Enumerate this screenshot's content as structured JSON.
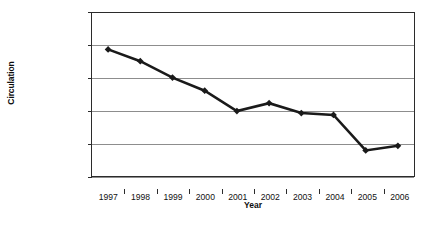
{
  "chart_data": {
    "type": "line",
    "title": "",
    "xlabel": "Year",
    "ylabel": "Circulation",
    "categories": [
      "1997",
      "1998",
      "1999",
      "2000",
      "2001",
      "2002",
      "2003",
      "2004",
      "2005",
      "2006"
    ],
    "values": [
      104300000,
      102500000,
      100000000,
      98000000,
      94900000,
      96100000,
      94600000,
      94300000,
      88900000,
      89600000
    ],
    "series": [
      {
        "name": "Circulation",
        "values": [
          104300000,
          102500000,
          100000000,
          98000000,
          94900000,
          96100000,
          94600000,
          94300000,
          88900000,
          89600000
        ]
      }
    ],
    "ylim": [
      85000000,
      110000000
    ],
    "ytick_values": [
      85000000,
      90000000,
      95000000,
      100000000,
      105000000,
      110000000
    ],
    "ytick_labels": [
      "85,000,000",
      "90,000,000",
      "95,000,000",
      "100,000,000",
      "105,000,000",
      "110,000,000"
    ],
    "xtick_labels": [
      "1997",
      "1998",
      "1999",
      "2000",
      "2001",
      "2002",
      "2003",
      "2004",
      "2005",
      "2006"
    ],
    "grid": true,
    "legend": "none",
    "marker": "diamond",
    "line_color": "#1a1a1a",
    "marker_color": "#1a1a1a",
    "grid_color": "#8d8d8d",
    "axis_color": "#2b2b2b",
    "background_color": "#ffffff",
    "annotations": []
  }
}
